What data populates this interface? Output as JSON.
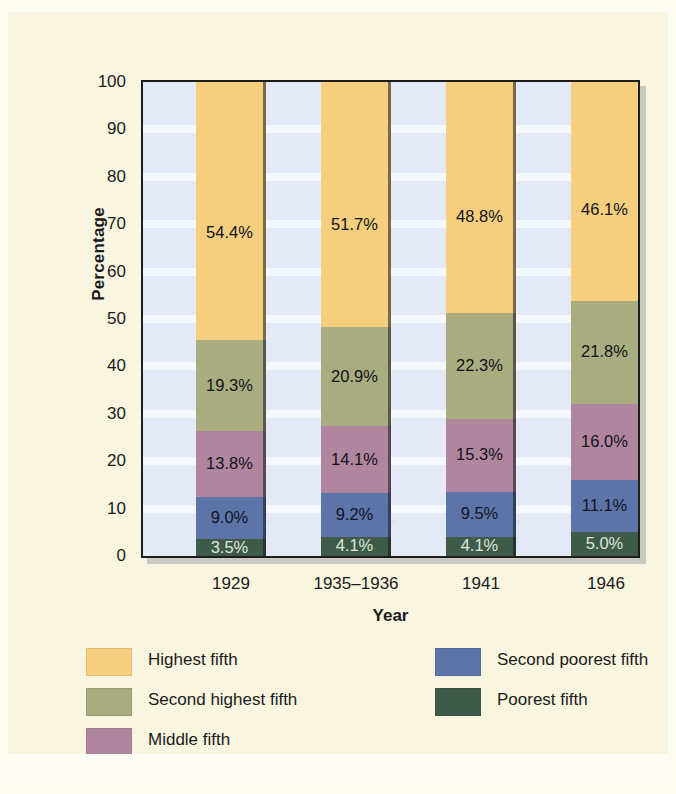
{
  "chart_data": {
    "type": "bar",
    "subtype": "stacked-bar-100",
    "title": "",
    "xlabel": "Year",
    "ylabel": "Percentage",
    "ylim": [
      0,
      100
    ],
    "yticks": [
      "100",
      "90",
      "80",
      "70",
      "60",
      "50",
      "40",
      "30",
      "20",
      "10",
      "0"
    ],
    "grid": "horizontal-bands",
    "legend_position": "bottom",
    "categories": [
      "1929",
      "1935–1936",
      "1941",
      "1946"
    ],
    "series": [
      {
        "name": "Poorest fifth",
        "color": "#3e5b4a",
        "values": [
          3.5,
          4.1,
          4.1,
          5.0
        ],
        "labels": [
          "3.5%",
          "4.1%",
          "4.1%",
          "5.0%"
        ]
      },
      {
        "name": "Second poorest fifth",
        "color": "#5c74a8",
        "values": [
          9.0,
          9.2,
          9.5,
          11.1
        ],
        "labels": [
          "9.0%",
          "9.2%",
          "9.5%",
          "11.1%"
        ]
      },
      {
        "name": "Middle fifth",
        "color": "#b0869e",
        "values": [
          13.8,
          14.1,
          15.3,
          16.0
        ],
        "labels": [
          "13.8%",
          "14.1%",
          "15.3%",
          "16.0%"
        ]
      },
      {
        "name": "Second highest fifth",
        "color": "#a9ac7e",
        "values": [
          19.3,
          20.9,
          22.3,
          21.8
        ],
        "labels": [
          "19.3%",
          "20.9%",
          "22.3%",
          "21.8%"
        ]
      },
      {
        "name": "Highest fifth",
        "color": "#f5ce7e",
        "values": [
          54.4,
          51.7,
          48.8,
          46.1
        ],
        "labels": [
          "54.4%",
          "51.7%",
          "48.8%",
          "46.1%"
        ]
      }
    ]
  },
  "legend": {
    "items": [
      {
        "label": "Highest fifth",
        "color": "#f5ce7e",
        "column": 0,
        "row": 0
      },
      {
        "label": "Second highest fifth",
        "color": "#a9ac7e",
        "column": 0,
        "row": 1
      },
      {
        "label": "Middle fifth",
        "color": "#b0869e",
        "column": 0,
        "row": 2
      },
      {
        "label": "Second poorest fifth",
        "color": "#5c74a8",
        "column": 1,
        "row": 0
      },
      {
        "label": "Poorest fifth",
        "color": "#3e5b4a",
        "column": 1,
        "row": 1
      }
    ]
  },
  "colors": {
    "page_background": "#faf5dc",
    "panel_background": "#e3eaf5",
    "panel_band": "#f4f8fd",
    "axis": "#1d1d1d",
    "text": "#1b1b1b"
  }
}
